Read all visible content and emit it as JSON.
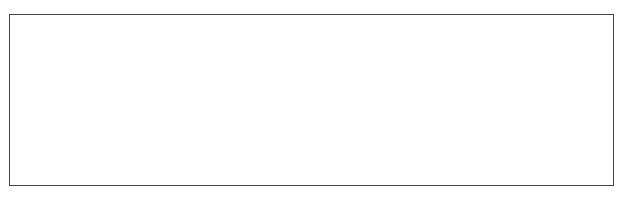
{
  "chart_data": {
    "type": "line",
    "title": "",
    "xlabel": "Time-->",
    "ylabel": "",
    "y_max_label": "7000000",
    "ylim": [
      0,
      7000000
    ],
    "xlim": [
      2.7,
      13.9
    ],
    "x_ticks": [
      "3.00",
      "4.00",
      "5.00",
      "6.00",
      "7.00",
      "8.00",
      "9.00",
      "10.00",
      "11.00",
      "12.00",
      "13.00"
    ],
    "grid": false,
    "peaks": [
      {
        "x": 7.45,
        "y": 700000
      },
      {
        "x": 7.55,
        "y": 550000
      },
      {
        "x": 7.7,
        "y": 400000
      },
      {
        "x": 7.92,
        "y": 3400000
      },
      {
        "x": 8.3,
        "y": 1800000
      },
      {
        "x": 8.7,
        "y": 2600000
      },
      {
        "x": 8.78,
        "y": 3900000
      },
      {
        "x": 8.9,
        "y": 1300000
      },
      {
        "x": 9.05,
        "y": 3300000
      },
      {
        "x": 9.12,
        "y": 5700000
      },
      {
        "x": 9.32,
        "y": 1800000
      },
      {
        "x": 9.5,
        "y": 4000000
      },
      {
        "x": 9.55,
        "y": 7000000
      },
      {
        "x": 9.75,
        "y": 1700000
      },
      {
        "x": 9.85,
        "y": 2400000
      },
      {
        "x": 9.93,
        "y": 4700000
      },
      {
        "x": 10.0,
        "y": 3000000
      },
      {
        "x": 10.08,
        "y": 2800000
      },
      {
        "x": 10.15,
        "y": 2600000
      },
      {
        "x": 10.25,
        "y": 3900000
      },
      {
        "x": 10.45,
        "y": 1800000
      },
      {
        "x": 10.6,
        "y": 700000
      },
      {
        "x": 10.75,
        "y": 900000
      },
      {
        "x": 10.85,
        "y": 1100000
      },
      {
        "x": 10.95,
        "y": 1200000
      },
      {
        "x": 11.05,
        "y": 1100000
      },
      {
        "x": 11.15,
        "y": 1000000
      },
      {
        "x": 11.25,
        "y": 850000
      },
      {
        "x": 11.35,
        "y": 700000
      },
      {
        "x": 11.5,
        "y": 350000
      },
      {
        "x": 11.75,
        "y": 250000
      },
      {
        "x": 11.9,
        "y": 300000
      },
      {
        "x": 12.05,
        "y": 200000
      },
      {
        "x": 12.3,
        "y": 100000
      }
    ]
  }
}
